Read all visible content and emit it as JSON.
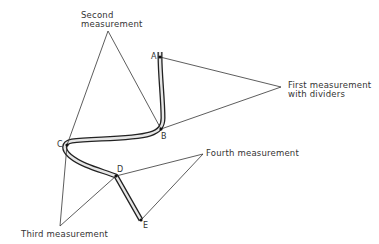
{
  "diagram": {
    "type": "measuring a curved line with dividers",
    "points": {
      "A": {
        "label": "A",
        "x": 160,
        "y": 57
      },
      "B": {
        "label": "B",
        "x": 161,
        "y": 129
      },
      "C": {
        "label": "C",
        "x": 67,
        "y": 145
      },
      "D": {
        "label": "D",
        "x": 116,
        "y": 176
      },
      "E": {
        "label": "E",
        "x": 141,
        "y": 220
      }
    },
    "measurements": [
      {
        "id": "first",
        "text_line1": "First measurement",
        "text_line2": "with dividers",
        "from": "A",
        "to": "B",
        "apex": {
          "x": 281,
          "y": 87
        }
      },
      {
        "id": "second",
        "text_line1": "Second",
        "text_line2": "measurement",
        "from": "B",
        "to": "C",
        "apex": {
          "x": 108,
          "y": 31
        }
      },
      {
        "id": "third",
        "text_line1": "Third measurement",
        "from": "C",
        "to": "D",
        "apex": {
          "x": 60,
          "y": 226
        }
      },
      {
        "id": "fourth",
        "text_line1": "Fourth measurement",
        "from": "D",
        "to": "E",
        "apex": {
          "x": 203,
          "y": 154
        }
      }
    ],
    "colors": {
      "line": "#333333",
      "curve_outline": "#222222",
      "curve_fill": "#e6e6e6",
      "background": "#ffffff"
    }
  }
}
